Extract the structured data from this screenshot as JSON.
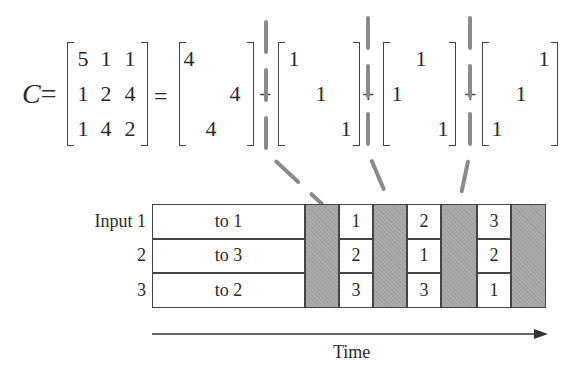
{
  "equation": {
    "lhs_label": "C",
    "equals": "=",
    "plus": "+",
    "matrix_C": [
      [
        "5",
        "1",
        "1"
      ],
      [
        "1",
        "2",
        "4"
      ],
      [
        "1",
        "4",
        "2"
      ]
    ],
    "terms": [
      {
        "name": "4P1",
        "cells": [
          [
            "4",
            "",
            ""
          ],
          [
            "",
            "",
            "4"
          ],
          [
            "",
            "4",
            ""
          ]
        ]
      },
      {
        "name": "P2",
        "cells": [
          [
            "1",
            "",
            ""
          ],
          [
            "",
            "1",
            ""
          ],
          [
            "",
            "",
            "1"
          ]
        ]
      },
      {
        "name": "P3",
        "cells": [
          [
            "",
            "1",
            ""
          ],
          [
            "1",
            "",
            ""
          ],
          [
            "",
            "",
            "1"
          ]
        ]
      },
      {
        "name": "P4",
        "cells": [
          [
            "",
            "",
            "1"
          ],
          [
            "",
            "1",
            ""
          ],
          [
            "1",
            "",
            ""
          ]
        ]
      }
    ]
  },
  "schedule": {
    "row_labels": [
      "Input 1",
      "2",
      "3"
    ],
    "first_slot": [
      "to 1",
      "to 3",
      "to 2"
    ],
    "slots": [
      [
        "1",
        "2",
        "3"
      ],
      [
        "2",
        "1",
        "3"
      ],
      [
        "3",
        "2",
        "1"
      ]
    ],
    "axis_label": "Time"
  },
  "colors": {
    "ink": "#2a2a2a",
    "reconfiguration_gray": "#a9a9a9",
    "dashed_line": "#8a8a8a"
  }
}
